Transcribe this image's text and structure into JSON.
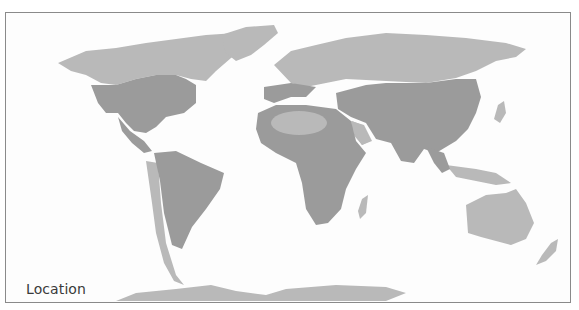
{
  "map": {
    "label": "Location",
    "colors": {
      "background": "#fdfdfd",
      "border": "#8a8a8a",
      "land": "#b9b9b9",
      "range": "#9b9b9b",
      "label_text": "#3a3a3a"
    },
    "legend": {
      "range_meaning": "darker gray = present range",
      "land_meaning": "lighter gray = outside range"
    }
  }
}
